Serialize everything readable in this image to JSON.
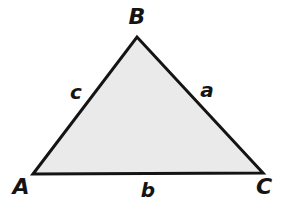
{
  "figure": {
    "kind": "geometry-diagram",
    "shape": "triangle",
    "width": 285,
    "height": 212,
    "background_color": "#ffffff",
    "fill_color": "#eaeaea",
    "stroke_color": "#141414",
    "stroke_width": 3,
    "label_color": "#141414"
  },
  "vertices": [
    {
      "name": "A",
      "label": "A",
      "x": 33,
      "y": 174,
      "label_x": 21,
      "label_y": 187
    },
    {
      "name": "B",
      "label": "B",
      "x": 137,
      "y": 37,
      "label_x": 137,
      "label_y": 17
    },
    {
      "name": "C",
      "label": "C",
      "x": 263,
      "y": 173,
      "label_x": 264,
      "label_y": 187
    }
  ],
  "sides": [
    {
      "name": "a",
      "label": "a",
      "between": "B-C",
      "label_x": 207,
      "label_y": 90
    },
    {
      "name": "b",
      "label": "b",
      "between": "A-C",
      "label_x": 148,
      "label_y": 190
    },
    {
      "name": "c",
      "label": "c",
      "between": "A-B",
      "label_x": 76,
      "label_y": 92
    }
  ],
  "polygon_points": "33,174 137,37 263,173"
}
